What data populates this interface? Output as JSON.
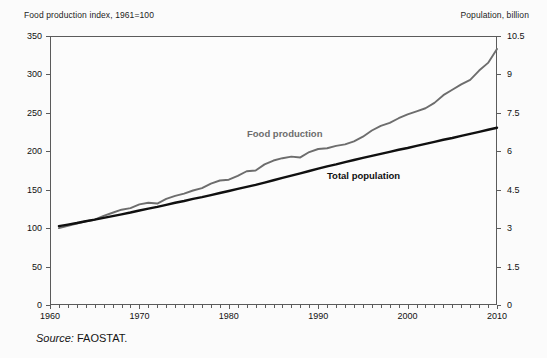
{
  "figure": {
    "left_axis_title": "Food production index, 1961=100",
    "right_axis_title": "Population, billion",
    "source_prefix": "Source:",
    "source_value": "FAOSTAT.",
    "colors": {
      "food_production_line": "#6d6d6d",
      "total_population_line": "#101010",
      "axis": "#5b5b5b",
      "background": "#fbfbfb"
    }
  },
  "chart_data": {
    "type": "line",
    "title": "",
    "xlabel": "",
    "ylabel": "Food production index, 1961=100",
    "y2label": "Population, billion",
    "grid": false,
    "legend": "inline-labels",
    "xlim": [
      1960,
      2010
    ],
    "ylim": [
      0,
      350
    ],
    "y2lim": [
      0,
      10.5
    ],
    "xticks": [
      1960,
      1970,
      1980,
      1990,
      2000,
      2010
    ],
    "xtick_labels": [
      "1960",
      "1970",
      "1980",
      "1990",
      "2000",
      "2010"
    ],
    "xminor_tick_interval": 1,
    "yticks": [
      0,
      50,
      100,
      150,
      200,
      250,
      300,
      350
    ],
    "ytick_labels": [
      "0",
      "50",
      "100",
      "150",
      "200",
      "250",
      "300",
      "350"
    ],
    "y2ticks": [
      0,
      1.5,
      3,
      4.5,
      6,
      7.5,
      9,
      10.5
    ],
    "y2tick_labels": [
      "0",
      "1.5",
      "3",
      "4.5",
      "6",
      "7.5",
      "9",
      "10.5"
    ],
    "x": [
      1961,
      1962,
      1963,
      1964,
      1965,
      1966,
      1967,
      1968,
      1969,
      1970,
      1971,
      1972,
      1973,
      1974,
      1975,
      1976,
      1977,
      1978,
      1979,
      1980,
      1981,
      1982,
      1983,
      1984,
      1985,
      1986,
      1987,
      1988,
      1989,
      1990,
      1991,
      1992,
      1993,
      1994,
      1995,
      1996,
      1997,
      1998,
      1999,
      2000,
      2001,
      2002,
      2003,
      2004,
      2005,
      2006,
      2007,
      2008,
      2009,
      2010
    ],
    "series": [
      {
        "name": "Food production",
        "axis": "left",
        "units": "index, 1961=100",
        "color": "#6d6d6d",
        "label_text": "Food production",
        "values": [
          100,
          103,
          106,
          109,
          111,
          116,
          120,
          124,
          126,
          131,
          133,
          132,
          138,
          142,
          145,
          149,
          152,
          158,
          162,
          163,
          168,
          174,
          175,
          183,
          188,
          191,
          193,
          192,
          199,
          203,
          204,
          207,
          209,
          213,
          219,
          227,
          233,
          237,
          243,
          248,
          252,
          256,
          263,
          273,
          280,
          287,
          293,
          305,
          315,
          333
        ]
      },
      {
        "name": "Total population",
        "axis": "right",
        "units": "billion",
        "color": "#101010",
        "label_text": "Total population",
        "values": [
          3.08,
          3.14,
          3.2,
          3.27,
          3.33,
          3.4,
          3.47,
          3.54,
          3.61,
          3.69,
          3.76,
          3.83,
          3.91,
          3.99,
          4.06,
          4.14,
          4.21,
          4.29,
          4.37,
          4.45,
          4.53,
          4.61,
          4.69,
          4.78,
          4.87,
          4.96,
          5.05,
          5.14,
          5.23,
          5.32,
          5.41,
          5.49,
          5.58,
          5.66,
          5.74,
          5.82,
          5.9,
          5.98,
          6.06,
          6.13,
          6.21,
          6.29,
          6.37,
          6.45,
          6.52,
          6.6,
          6.68,
          6.76,
          6.84,
          6.92
        ]
      }
    ]
  }
}
